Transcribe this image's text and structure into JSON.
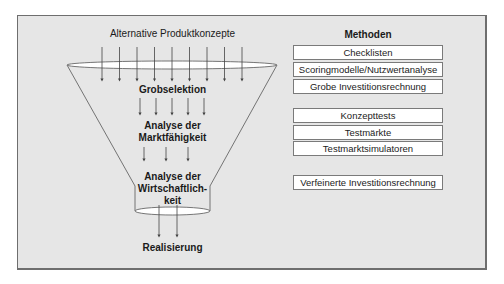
{
  "diagram": {
    "funnel": {
      "input_label": "Alternative Produktkonzepte",
      "stages": [
        {
          "label": "Grobselektion"
        },
        {
          "label_lines": [
            "Analyse der",
            "Marktfähigkeit"
          ]
        },
        {
          "label_lines": [
            "Analyse der",
            "Wirtschaftlich-",
            "keit"
          ]
        }
      ],
      "output_label": "Realisierung",
      "arrow_counts": [
        9,
        5,
        3,
        2
      ]
    },
    "methods": {
      "title": "Methoden",
      "groups": [
        [
          "Checklisten",
          "Scoringmodelle/Nutzwertanalyse",
          "Grobe Investitionsrechnung"
        ],
        [
          "Konzepttests",
          "Testmärkte",
          "Testmarktsimulatoren"
        ],
        [
          "Verfeinerte Investitionsrechnung"
        ]
      ]
    },
    "colors": {
      "background": "#e6e6e6",
      "line": "#555555",
      "box_fill": "#ffffff"
    }
  }
}
